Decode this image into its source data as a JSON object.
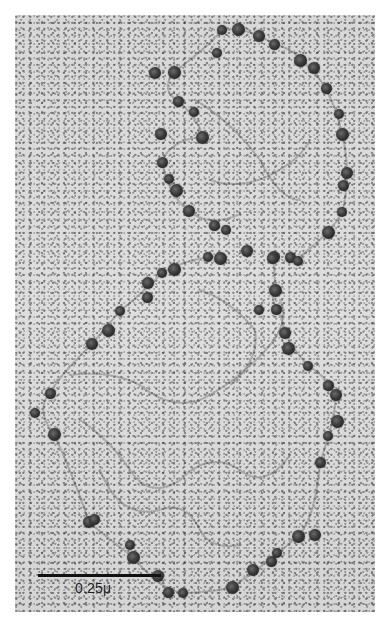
{
  "image": {
    "type": "electron-micrograph",
    "subject": "chromatin fibers with nucleosome beads forming two loops",
    "background_color": "#dcdcdc",
    "bead_color": "#2e2e2e"
  },
  "scale_bar": {
    "label": "0.25μ",
    "color": "#111111"
  },
  "beads": {
    "top_loop": [
      [
        222,
        30
      ],
      [
        238,
        29
      ],
      [
        259,
        36
      ],
      [
        274,
        44
      ],
      [
        217,
        53
      ],
      [
        174,
        72
      ],
      [
        155,
        73
      ],
      [
        178,
        101
      ],
      [
        194,
        112
      ],
      [
        202,
        137
      ],
      [
        161,
        134
      ],
      [
        162,
        162
      ],
      [
        169,
        179
      ],
      [
        176,
        190
      ],
      [
        189,
        211
      ],
      [
        214,
        225
      ],
      [
        226,
        230
      ],
      [
        300,
        60
      ],
      [
        314,
        68
      ],
      [
        326,
        88
      ],
      [
        339,
        114
      ],
      [
        342,
        134
      ],
      [
        347,
        173
      ],
      [
        343,
        185
      ],
      [
        342,
        212
      ],
      [
        328,
        232
      ],
      [
        274,
        257
      ],
      [
        290,
        257
      ],
      [
        298,
        261
      ]
    ],
    "bottom_loop": [
      [
        208,
        257
      ],
      [
        220,
        258
      ],
      [
        247,
        251
      ],
      [
        272,
        258
      ],
      [
        162,
        273
      ],
      [
        174,
        269
      ],
      [
        148,
        283
      ],
      [
        147,
        297
      ],
      [
        120,
        311
      ],
      [
        108,
        330
      ],
      [
        92,
        344
      ],
      [
        50,
        393
      ],
      [
        35,
        413
      ],
      [
        54,
        434
      ],
      [
        89,
        522
      ],
      [
        94,
        519
      ],
      [
        130,
        545
      ],
      [
        133,
        557
      ],
      [
        158,
        576
      ],
      [
        168,
        592
      ],
      [
        183,
        593
      ],
      [
        232,
        587
      ],
      [
        253,
        570
      ],
      [
        271,
        561
      ],
      [
        277,
        553
      ],
      [
        298,
        536
      ],
      [
        315,
        535
      ],
      [
        320,
        462
      ],
      [
        328,
        436
      ],
      [
        337,
        421
      ],
      [
        336,
        395
      ],
      [
        328,
        385
      ],
      [
        308,
        366
      ],
      [
        288,
        348
      ],
      [
        285,
        333
      ],
      [
        276,
        309
      ],
      [
        259,
        310
      ],
      [
        275,
        290
      ]
    ]
  }
}
